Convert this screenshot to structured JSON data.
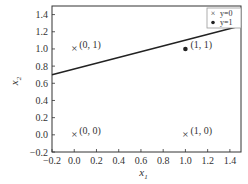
{
  "chart_data": {
    "type": "scatter",
    "title": "",
    "xlabel": "x1",
    "ylabel": "x2",
    "xlim": [
      -0.2,
      1.5
    ],
    "ylim": [
      -0.2,
      1.5
    ],
    "grid": false,
    "legend_position": "upper right",
    "x_ticks": [
      -0.2,
      0.0,
      0.2,
      0.4,
      0.6,
      0.8,
      1.0,
      1.2,
      1.4
    ],
    "x_tick_labels": [
      "−0.2",
      "0.0",
      "0.2",
      "0.4",
      "0.6",
      "0.8",
      "1.0",
      "1.2",
      "1.4"
    ],
    "y_ticks": [
      -0.2,
      0.0,
      0.2,
      0.4,
      0.6,
      0.8,
      1.0,
      1.2,
      1.4
    ],
    "y_tick_labels": [
      "−0.2",
      "0.0",
      "0.2",
      "0.4",
      "0.6",
      "0.8",
      "1.0",
      "1.2",
      "1.4"
    ],
    "series": [
      {
        "name": "y=0",
        "marker": "x",
        "points": [
          {
            "x": 0,
            "y": 0,
            "label": "(0, 0)"
          },
          {
            "x": 0,
            "y": 1,
            "label": "(0, 1)"
          },
          {
            "x": 1,
            "y": 0,
            "label": "(1, 0)"
          }
        ]
      },
      {
        "name": "y=1",
        "marker": "dot",
        "points": [
          {
            "x": 1,
            "y": 1,
            "label": "(1, 1)"
          }
        ]
      }
    ],
    "decision_boundary": {
      "type": "line",
      "points": [
        {
          "x": -0.2,
          "y": 0.7
        },
        {
          "x": 1.5,
          "y": 1.27
        }
      ]
    },
    "legend": [
      {
        "marker": "×",
        "label": "y=0"
      },
      {
        "marker": "•",
        "label": "y=1"
      }
    ]
  },
  "colors": {
    "frame": "#333333",
    "line": "#222222",
    "marker": "#222222",
    "legend_border": "#999999"
  },
  "axes": {
    "xlabel_main": "x",
    "xlabel_sub": "1",
    "ylabel_main": "x",
    "ylabel_sub": "2"
  }
}
